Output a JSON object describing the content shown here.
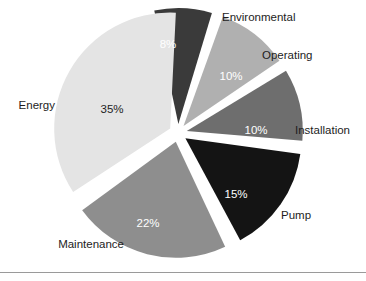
{
  "chart_data": {
    "type": "pie",
    "title": "",
    "subtitle": "",
    "xlabel": "",
    "ylabel": "",
    "legend_position": "outside-labels",
    "grid": false,
    "exploded": true,
    "units": "percent",
    "total": 100,
    "categories": [
      "Environmental",
      "Operating",
      "Installation",
      "Pump",
      "Maintenance",
      "Energy"
    ],
    "values": [
      8,
      10,
      10,
      15,
      22,
      35
    ],
    "value_labels": [
      "8%",
      "10%",
      "10%",
      "15%",
      "22%",
      "35%"
    ],
    "colors": [
      "#3a3a3a",
      "#b0b0b0",
      "#6e6e6e",
      "#141414",
      "#8e8e8e",
      "#e4e4e4"
    ],
    "slices": [
      {
        "label": "Environmental",
        "value": 8,
        "value_label": "8%",
        "color": "#3a3a3a",
        "value_text_color": "#ffffff",
        "start_angle": -12,
        "end_angle": 16.8,
        "label_x": 222,
        "label_y": 21,
        "label_anchor": "start",
        "value_x": 168,
        "value_y": 48
      },
      {
        "label": "Operating",
        "value": 10,
        "value_label": "10%",
        "color": "#b0b0b0",
        "value_text_color": "#ffffff",
        "start_angle": 19.8,
        "end_angle": 55.8,
        "label_x": 262,
        "label_y": 59,
        "label_anchor": "start",
        "value_x": 231,
        "value_y": 80
      },
      {
        "label": "Installation",
        "value": 10,
        "value_label": "10%",
        "color": "#6e6e6e",
        "value_text_color": "#ffffff",
        "start_angle": 58.8,
        "end_angle": 94.8,
        "label_x": 295,
        "label_y": 134,
        "label_anchor": "start",
        "value_x": 256,
        "value_y": 134
      },
      {
        "label": "Pump",
        "value": 15,
        "value_label": "15%",
        "color": "#141414",
        "value_text_color": "#ffffff",
        "start_angle": 97.8,
        "end_angle": 151.8,
        "label_x": 281,
        "label_y": 219,
        "label_anchor": "start",
        "value_x": 236,
        "value_y": 198
      },
      {
        "label": "Maintenance",
        "value": 22,
        "value_label": "22%",
        "color": "#8e8e8e",
        "value_text_color": "#ffffff",
        "start_angle": 154.8,
        "end_angle": 233.8,
        "label_x": 124,
        "label_y": 248,
        "label_anchor": "end",
        "value_x": 148,
        "value_y": 227
      },
      {
        "label": "Energy",
        "value": 35,
        "value_label": "35%",
        "color": "#e4e4e4",
        "value_text_color": "#1d1d1d",
        "start_angle": 236.8,
        "end_angle": 362.8,
        "label_x": 55,
        "label_y": 109,
        "label_anchor": "end",
        "value_x": 112,
        "value_y": 113
      }
    ],
    "geometry": {
      "center_x": 178,
      "center_y": 133,
      "radius": 116,
      "explode_offset": 9
    }
  },
  "footer": {
    "rule_visible": true
  }
}
